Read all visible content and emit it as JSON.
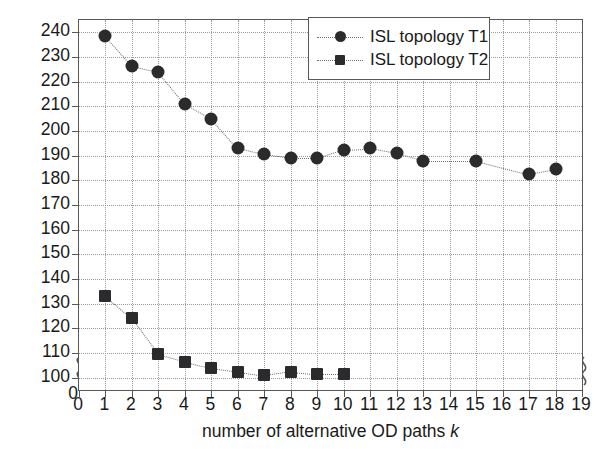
{
  "chart_data": {
    "type": "scatter",
    "title": "",
    "xlabel": "number of alternative OD paths k",
    "xlabel_plain": "number of alternative OD paths ",
    "xlabel_italic": "k",
    "ylabel": "WCL traffic load (mean)",
    "xlim": [
      0,
      19
    ],
    "ylim": [
      95,
      245
    ],
    "yaxis_broken_at_zero": true,
    "grid": true,
    "legend_position": "top-right",
    "xticks": [
      0,
      1,
      2,
      3,
      4,
      5,
      6,
      7,
      8,
      9,
      10,
      11,
      12,
      13,
      14,
      15,
      16,
      17,
      18,
      19
    ],
    "xtick_labels": [
      "0",
      "1",
      "2",
      "3",
      "4",
      "5",
      "6",
      "7",
      "8",
      "9",
      "10",
      "11",
      "12",
      "13",
      "14",
      "15",
      "16",
      "17",
      "18",
      "19"
    ],
    "yticks": [
      100,
      110,
      120,
      130,
      140,
      150,
      160,
      170,
      180,
      190,
      200,
      210,
      220,
      230,
      240
    ],
    "ytick_labels": [
      "100",
      "110",
      "120",
      "130",
      "140",
      "150",
      "160",
      "170",
      "180",
      "190",
      "200",
      "210",
      "220",
      "230",
      "240"
    ],
    "y_zero_label": "0",
    "series": [
      {
        "name": "ISL topology T1",
        "marker": "circle",
        "color": "#2b2b2d",
        "linestyle": "dotted",
        "x": [
          1,
          2,
          3,
          4,
          5,
          6,
          7,
          8,
          9,
          10,
          11,
          12,
          13,
          15,
          17,
          18
        ],
        "values": [
          238.5,
          226.5,
          224,
          211,
          205,
          193,
          190.5,
          189,
          189,
          192.5,
          193,
          191,
          188,
          188,
          182.5,
          184.5
        ]
      },
      {
        "name": "ISL topology T2",
        "marker": "square",
        "color": "#2b2b2d",
        "linestyle": "dotted",
        "x": [
          1,
          2,
          3,
          4,
          5,
          6,
          7,
          8,
          9,
          10
        ],
        "values": [
          133,
          124,
          109.5,
          106.5,
          104,
          102.5,
          101,
          102.5,
          101.5,
          101.5
        ]
      }
    ]
  },
  "legend": {
    "items": [
      {
        "label": "ISL topology T1",
        "marker": "circle"
      },
      {
        "label": "ISL topology T2",
        "marker": "square"
      }
    ]
  }
}
